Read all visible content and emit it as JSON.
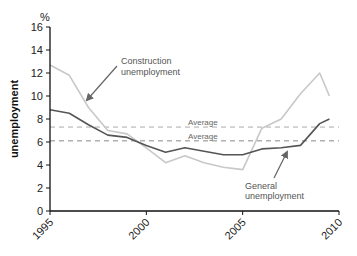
{
  "chart_data": {
    "type": "line",
    "title": "",
    "xlabel": "",
    "ylabel": "unemployment",
    "y_unit": "%",
    "xlim": [
      1995,
      2010
    ],
    "ylim": [
      0,
      16
    ],
    "x_ticks": [
      1995,
      2000,
      2005,
      2010
    ],
    "y_ticks": [
      0,
      2,
      4,
      6,
      8,
      10,
      12,
      14,
      16
    ],
    "grid": false,
    "legend": "none (inline annotations)",
    "x": [
      1995,
      1996,
      1997,
      1998,
      1999,
      2000,
      2001,
      2002,
      2003,
      2004,
      2005,
      2006,
      2007,
      2008,
      2009,
      2009.5
    ],
    "series": [
      {
        "name": "General unemployment",
        "color": "#555555",
        "values": [
          8.8,
          8.5,
          7.5,
          6.6,
          6.4,
          5.7,
          5.1,
          5.5,
          5.2,
          4.9,
          4.9,
          5.4,
          5.5,
          5.7,
          7.6,
          8.0
        ]
      },
      {
        "name": "Construction unemployment",
        "color": "#c8c8c8",
        "values": [
          12.7,
          11.8,
          9.0,
          7.0,
          6.7,
          5.5,
          4.2,
          4.8,
          4.2,
          3.8,
          3.6,
          7.2,
          8.0,
          10.2,
          12.0,
          10.0
        ]
      }
    ],
    "reference_lines": [
      {
        "label": "Average",
        "value": 7.3,
        "series": "Construction unemployment",
        "style": "dashed",
        "color": "#aaaaaa"
      },
      {
        "label": "Average",
        "value": 6.1,
        "series": "General unemployment",
        "style": "dashed",
        "color": "#888888"
      }
    ],
    "annotations": [
      {
        "text": [
          "Construction",
          "unemployment"
        ],
        "target_series": "Construction unemployment"
      },
      {
        "text": [
          "General",
          "unemployment"
        ],
        "target_series": "General unemployment"
      }
    ]
  }
}
